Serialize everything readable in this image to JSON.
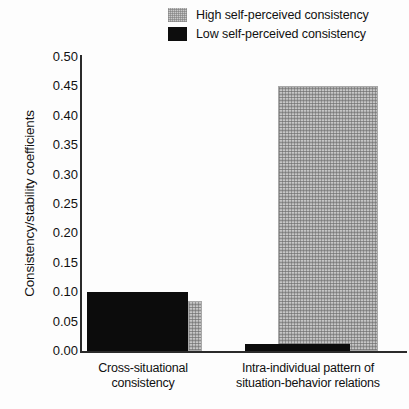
{
  "chart_data": {
    "type": "bar",
    "title": "",
    "xlabel": "",
    "ylabel": "Consistency/stability coefficients",
    "ylim": [
      0.0,
      0.5
    ],
    "ytick_labels": [
      "0.50",
      "0.45",
      "0.40",
      "0.35",
      "0.30",
      "0.25",
      "0.20",
      "0.15",
      "0.10",
      "0.05",
      "0.00"
    ],
    "ytick_values": [
      0.5,
      0.45,
      0.4,
      0.35,
      0.3,
      0.25,
      0.2,
      0.15,
      0.1,
      0.05,
      0.0
    ],
    "grid": false,
    "legend_position": "top-right",
    "categories": [
      "Cross-situational consistency",
      "Intra-individual pattern of situation-behavior relations"
    ],
    "category_lines": [
      [
        "Cross-situational",
        "consistency"
      ],
      [
        "Intra-individual pattern of",
        "situation-behavior relations"
      ]
    ],
    "series": [
      {
        "name": "High self-perceived consistency",
        "color": "#c6c6c6",
        "pattern": "stipple",
        "values": [
          0.085,
          0.45
        ]
      },
      {
        "name": "Low self-perceived consistency",
        "color": "#0c0c0c",
        "pattern": "solid",
        "values": [
          0.1,
          0.012
        ]
      }
    ]
  },
  "legend": {
    "items": [
      {
        "label": "High self-perceived consistency",
        "swatch": "high-swatch"
      },
      {
        "label": "Low self-perceived consistency",
        "swatch": "low-swatch"
      }
    ]
  },
  "axes": {
    "y_title": "Consistency/stability coefficients",
    "y_ticks": [
      "0.50",
      "0.45",
      "0.40",
      "0.35",
      "0.30",
      "0.25",
      "0.20",
      "0.15",
      "0.10",
      "0.05",
      "0.00"
    ]
  },
  "x_labels": {
    "group0_line1": "Cross-situational",
    "group0_line2": "consistency",
    "group1_line1": "Intra-individual pattern of",
    "group1_line2": "situation-behavior relations"
  },
  "geometry": {
    "baseline_y": 351,
    "top_y": 57,
    "px_per_unit": 588,
    "bars": [
      {
        "name": "group0-high",
        "left": 188,
        "width": 14,
        "value_key": "chart_data.series.0.values.0"
      },
      {
        "name": "group0-low",
        "left": 87,
        "width": 101,
        "value_key": "chart_data.series.1.values.0"
      },
      {
        "name": "group1-high",
        "left": 278,
        "width": 100,
        "value_key": "chart_data.series.0.values.1"
      },
      {
        "name": "group1-low",
        "left": 245,
        "width": 105,
        "value_key": "chart_data.series.1.values.1"
      }
    ]
  }
}
